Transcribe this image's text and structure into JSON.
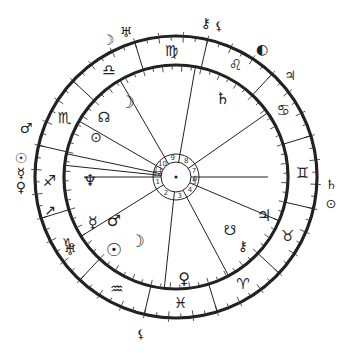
{
  "chart": {
    "center": [
      176,
      177
    ],
    "outer_radius": 141,
    "inner_radius": 112,
    "house_ring_outer": 23,
    "house_ring_inner": 15,
    "colors": {
      "ink": "#222222",
      "background": "#ffffff"
    }
  },
  "signs": [
    {
      "name": "virgo",
      "glyph": "♍",
      "angle": 92
    },
    {
      "name": "leo",
      "glyph": "♌",
      "angle": 62
    },
    {
      "name": "cancer",
      "glyph": "♋",
      "angle": 32
    },
    {
      "name": "gemini",
      "glyph": "♊",
      "angle": 2
    },
    {
      "name": "taurus",
      "glyph": "♉",
      "angle": -28
    },
    {
      "name": "aries",
      "glyph": "♈",
      "angle": -58
    },
    {
      "name": "pisces",
      "glyph": "♓",
      "angle": -88
    },
    {
      "name": "aquarius",
      "glyph": "♒",
      "angle": -118
    },
    {
      "name": "capricorn",
      "glyph": "♑",
      "angle": -148
    },
    {
      "name": "sagittarius",
      "glyph": "♐",
      "angle": -178
    },
    {
      "name": "scorpio",
      "glyph": "♏",
      "angle": 152
    },
    {
      "name": "libra",
      "glyph": "♎",
      "angle": 122
    }
  ],
  "sign_boundaries": [
    17,
    47,
    77,
    107,
    137,
    167,
    197,
    227,
    257,
    287,
    317,
    347
  ],
  "house_cusps": [
    180,
    212,
    264,
    298,
    337,
    0,
    35,
    80,
    120,
    150,
    168,
    174
  ],
  "houses": [
    {
      "num": "1",
      "angle": 196
    },
    {
      "num": "2",
      "angle": 238
    },
    {
      "num": "3",
      "angle": 281
    },
    {
      "num": "4",
      "angle": 317
    },
    {
      "num": "5",
      "angle": 345
    },
    {
      "num": "6",
      "angle": 355
    },
    {
      "num": "7",
      "angle": 18
    },
    {
      "num": "8",
      "angle": 57
    },
    {
      "num": "9",
      "angle": 100
    },
    {
      "num": "10",
      "angle": 135
    },
    {
      "num": "11",
      "angle": 159
    },
    {
      "num": "12",
      "angle": 171
    }
  ],
  "inner_planets": [
    {
      "name": "moon",
      "glyph": "☽",
      "x": 127,
      "y": 102,
      "size": 17
    },
    {
      "name": "north-node",
      "glyph": "☊",
      "x": 104,
      "y": 117,
      "size": 14
    },
    {
      "name": "part-of-fortune",
      "glyph": "⊙",
      "x": 96,
      "y": 137,
      "size": 14
    },
    {
      "name": "saturn",
      "glyph": "♄",
      "x": 223,
      "y": 98,
      "size": 16
    },
    {
      "name": "neptune",
      "glyph": "♆",
      "x": 90,
      "y": 180,
      "size": 16
    },
    {
      "name": "mercury",
      "glyph": "☿",
      "x": 93,
      "y": 222,
      "size": 16
    },
    {
      "name": "mars",
      "glyph": "♂",
      "x": 114,
      "y": 220,
      "size": 16
    },
    {
      "name": "sun",
      "glyph": "☉",
      "x": 114,
      "y": 249,
      "size": 18
    },
    {
      "name": "moon-2",
      "glyph": "☽",
      "x": 137,
      "y": 241,
      "size": 17
    },
    {
      "name": "uranus",
      "glyph": "♅",
      "x": 70,
      "y": 250,
      "size": 14
    },
    {
      "name": "venus",
      "glyph": "♀",
      "x": 184,
      "y": 278,
      "size": 16
    },
    {
      "name": "jupiter",
      "glyph": "♃",
      "x": 264,
      "y": 215,
      "size": 16
    },
    {
      "name": "south-node",
      "glyph": "☋",
      "x": 230,
      "y": 230,
      "size": 14
    },
    {
      "name": "chiron",
      "glyph": "⚷",
      "x": 243,
      "y": 246,
      "size": 14
    },
    {
      "name": "pluto",
      "glyph": "♇",
      "x": 84,
      "y": 135,
      "size": 0
    }
  ],
  "outer_planets": [
    {
      "name": "moon-outer",
      "glyph": "☽",
      "x": 108,
      "y": 40,
      "size": 14
    },
    {
      "name": "uranus-outer",
      "glyph": "♅",
      "x": 126,
      "y": 32,
      "size": 14
    },
    {
      "name": "chiron-outer",
      "glyph": "⚷",
      "x": 206,
      "y": 23,
      "size": 14
    },
    {
      "name": "lilith-outer",
      "glyph": "⚸",
      "x": 219,
      "y": 26,
      "size": 12
    },
    {
      "name": "sun-outer-top",
      "glyph": "◐",
      "x": 262,
      "y": 49,
      "size": 14
    },
    {
      "name": "jupiter-outer",
      "glyph": "♃",
      "x": 290,
      "y": 75,
      "size": 13
    },
    {
      "name": "mars-outer",
      "glyph": "♂",
      "x": 26,
      "y": 128,
      "size": 14
    },
    {
      "name": "sun-outer",
      "glyph": "☉",
      "x": 21,
      "y": 158,
      "size": 14
    },
    {
      "name": "mercury-outer",
      "glyph": "☿",
      "x": 21,
      "y": 173,
      "size": 14
    },
    {
      "name": "venus-outer",
      "glyph": "♀",
      "x": 21,
      "y": 187,
      "size": 14
    },
    {
      "name": "arrow-marker",
      "glyph": "↗",
      "x": 50,
      "y": 210,
      "size": 14
    },
    {
      "name": "saturn-outer",
      "glyph": "♄",
      "x": 331,
      "y": 184,
      "size": 13
    },
    {
      "name": "fortune-outer",
      "glyph": "⊙",
      "x": 331,
      "y": 203,
      "size": 13
    },
    {
      "name": "lilith-bottom",
      "glyph": "⚸",
      "x": 141,
      "y": 334,
      "size": 12
    }
  ]
}
